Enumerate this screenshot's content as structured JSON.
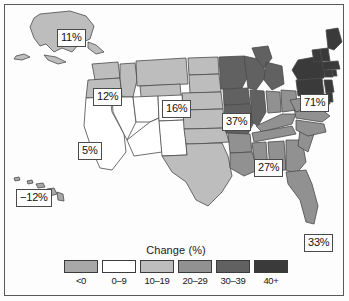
{
  "figure": {
    "title": "",
    "frame": true
  },
  "chart_data": {
    "type": "map",
    "map_kind": "choropleth",
    "region": "United States",
    "title": "Change (%)",
    "legend": {
      "title": "Change (%)",
      "position": "bottom-center",
      "classes": [
        {
          "label": "<0",
          "color": "#a8a8a8",
          "min": null,
          "max": 0
        },
        {
          "label": "0–9",
          "color": "#ffffff",
          "min": 0,
          "max": 9
        },
        {
          "label": "10–19",
          "color": "#bdbdbd",
          "min": 10,
          "max": 19
        },
        {
          "label": "20–29",
          "color": "#919191",
          "min": 20,
          "max": 29
        },
        {
          "label": "30–39",
          "color": "#616161",
          "min": 30,
          "max": 39
        },
        {
          "label": "40+",
          "color": "#3a3a3a",
          "min": 40,
          "max": null
        }
      ]
    },
    "annotations": [
      {
        "id": "alaska",
        "label": "11%",
        "value": 11,
        "class": "10–19",
        "x": 57,
        "y": 29
      },
      {
        "id": "oregon",
        "label": "12%",
        "value": 12,
        "class": "10–19",
        "x": 93,
        "y": 88
      },
      {
        "id": "north-plains",
        "label": "16%",
        "value": 16,
        "class": "10–19",
        "x": 162,
        "y": 100
      },
      {
        "id": "midwest",
        "label": "37%",
        "value": 37,
        "class": "30–39",
        "x": 222,
        "y": 113
      },
      {
        "id": "northeast",
        "label": "71%",
        "value": 71,
        "class": "40+",
        "x": 300,
        "y": 94
      },
      {
        "id": "colorado",
        "label": "5%",
        "value": 5,
        "class": "0–9",
        "x": 78,
        "y": 142
      },
      {
        "id": "southeast",
        "label": "27%",
        "value": 27,
        "class": "20–29",
        "x": 254,
        "y": 159
      },
      {
        "id": "hawaii",
        "label": "−12%",
        "value": -12,
        "class": "<0",
        "x": 16,
        "y": 189
      },
      {
        "id": "territory",
        "label": "33%",
        "value": 33,
        "class": "30–39",
        "x": 304,
        "y": 234
      }
    ],
    "values": [
      {
        "region": "Alaska",
        "value": 11,
        "class": "10–19"
      },
      {
        "region": "Hawaii",
        "value": -12,
        "class": "<0"
      },
      {
        "region": "Washington",
        "value": 16,
        "class": "10–19"
      },
      {
        "region": "Oregon",
        "value": 12,
        "class": "10–19"
      },
      {
        "region": "Idaho",
        "value": 16,
        "class": "10–19"
      },
      {
        "region": "Montana",
        "value": 16,
        "class": "10–19"
      },
      {
        "region": "Wyoming",
        "value": 16,
        "class": "10–19"
      },
      {
        "region": "North Dakota",
        "value": 16,
        "class": "10–19"
      },
      {
        "region": "South Dakota",
        "value": 16,
        "class": "10–19"
      },
      {
        "region": "Nebraska",
        "value": 16,
        "class": "10–19"
      },
      {
        "region": "California",
        "value": 5,
        "class": "0–9"
      },
      {
        "region": "Nevada",
        "value": 5,
        "class": "0–9"
      },
      {
        "region": "Utah",
        "value": 5,
        "class": "0–9"
      },
      {
        "region": "Arizona",
        "value": 5,
        "class": "0–9"
      },
      {
        "region": "Colorado",
        "value": 5,
        "class": "0–9"
      },
      {
        "region": "New Mexico",
        "value": 5,
        "class": "0–9"
      },
      {
        "region": "Kansas",
        "value": 16,
        "class": "10–19"
      },
      {
        "region": "Oklahoma",
        "value": 16,
        "class": "10–19"
      },
      {
        "region": "Texas",
        "value": 16,
        "class": "10–19"
      },
      {
        "region": "Minnesota",
        "value": 37,
        "class": "30–39"
      },
      {
        "region": "Iowa",
        "value": 37,
        "class": "30–39"
      },
      {
        "region": "Missouri",
        "value": 37,
        "class": "30–39"
      },
      {
        "region": "Arkansas",
        "value": 27,
        "class": "20–29"
      },
      {
        "region": "Louisiana",
        "value": 27,
        "class": "20–29"
      },
      {
        "region": "Wisconsin",
        "value": 37,
        "class": "30–39"
      },
      {
        "region": "Illinois",
        "value": 37,
        "class": "30–39"
      },
      {
        "region": "Michigan",
        "value": 37,
        "class": "30–39"
      },
      {
        "region": "Indiana",
        "value": 27,
        "class": "20–29"
      },
      {
        "region": "Ohio",
        "value": 27,
        "class": "20–29"
      },
      {
        "region": "Kentucky",
        "value": 27,
        "class": "20–29"
      },
      {
        "region": "Tennessee",
        "value": 27,
        "class": "20–29"
      },
      {
        "region": "Mississippi",
        "value": 27,
        "class": "20–29"
      },
      {
        "region": "Alabama",
        "value": 27,
        "class": "20–29"
      },
      {
        "region": "Georgia",
        "value": 27,
        "class": "20–29"
      },
      {
        "region": "Florida",
        "value": 27,
        "class": "20–29"
      },
      {
        "region": "South Carolina",
        "value": 27,
        "class": "20–29"
      },
      {
        "region": "North Carolina",
        "value": 27,
        "class": "20–29"
      },
      {
        "region": "Virginia",
        "value": 27,
        "class": "20–29"
      },
      {
        "region": "West Virginia",
        "value": 27,
        "class": "20–29"
      },
      {
        "region": "Pennsylvania",
        "value": 71,
        "class": "40+"
      },
      {
        "region": "New York",
        "value": 71,
        "class": "40+"
      },
      {
        "region": "Maryland",
        "value": 71,
        "class": "40+"
      },
      {
        "region": "Delaware",
        "value": 71,
        "class": "40+"
      },
      {
        "region": "New Jersey",
        "value": 71,
        "class": "40+"
      },
      {
        "region": "Connecticut",
        "value": 71,
        "class": "40+"
      },
      {
        "region": "Rhode Island",
        "value": 71,
        "class": "40+"
      },
      {
        "region": "Massachusetts",
        "value": 71,
        "class": "40+"
      },
      {
        "region": "Vermont",
        "value": 71,
        "class": "40+"
      },
      {
        "region": "New Hampshire",
        "value": 71,
        "class": "40+"
      },
      {
        "region": "Maine",
        "value": 71,
        "class": "40+"
      }
    ]
  },
  "colors": {
    "stroke": "#4a4a4c",
    "frame": "#58595b",
    "text": "#111111",
    "background": "#fdfdfd"
  }
}
